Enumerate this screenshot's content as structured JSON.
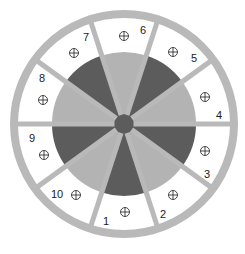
{
  "diagram": {
    "type": "circular-sector-layout",
    "center": [
      124,
      124
    ],
    "outer_ring": {
      "outer_radius": 114,
      "inner_radius": 106,
      "color": "#b9b9b9"
    },
    "spokes": {
      "count": 10,
      "angle_step_deg": 36,
      "start_angle_deg": 0,
      "width": 5,
      "color": "#b9b9b9"
    },
    "pie": {
      "radius": 72,
      "light_color": "#b3b3b3",
      "dark_color": "#5c5c5c"
    },
    "hub": {
      "radius": 10,
      "color": "#5c5c5c"
    },
    "segments": [
      {
        "label": "1",
        "pie_shade": "dark",
        "label_pos": [
          106,
          221
        ],
        "marker_pos": [
          125,
          212
        ]
      },
      {
        "label": "2",
        "pie_shade": "light",
        "label_pos": [
          163,
          214
        ],
        "marker_pos": [
          173,
          195
        ]
      },
      {
        "label": "3",
        "pie_shade": "dark",
        "label_pos": [
          207,
          174
        ],
        "marker_pos": [
          205,
          151
        ]
      },
      {
        "label": "4",
        "pie_shade": "light",
        "label_pos": [
          219,
          115
        ],
        "marker_pos": [
          205,
          97
        ]
      },
      {
        "label": "5",
        "pie_shade": "dark",
        "label_pos": [
          194,
          58
        ],
        "marker_pos": [
          173,
          52
        ]
      },
      {
        "label": "6",
        "pie_shade": "light",
        "label_pos": [
          143,
          30
        ],
        "marker_pos": [
          124,
          36
        ]
      },
      {
        "label": "7",
        "pie_shade": "dark",
        "label_pos": [
          86,
          37
        ],
        "marker_pos": [
          74,
          53
        ]
      },
      {
        "label": "8",
        "pie_shade": "light",
        "label_pos": [
          42,
          78
        ],
        "marker_pos": [
          43,
          100
        ]
      },
      {
        "label": "9",
        "pie_shade": "dark",
        "label_pos": [
          32,
          138
        ],
        "marker_pos": [
          44,
          155
        ]
      },
      {
        "label": "10",
        "pie_shade": "light",
        "label_pos": [
          57,
          194
        ],
        "marker_pos": [
          76,
          195
        ]
      }
    ],
    "marker_icon": "circled-plus-crosshair"
  }
}
